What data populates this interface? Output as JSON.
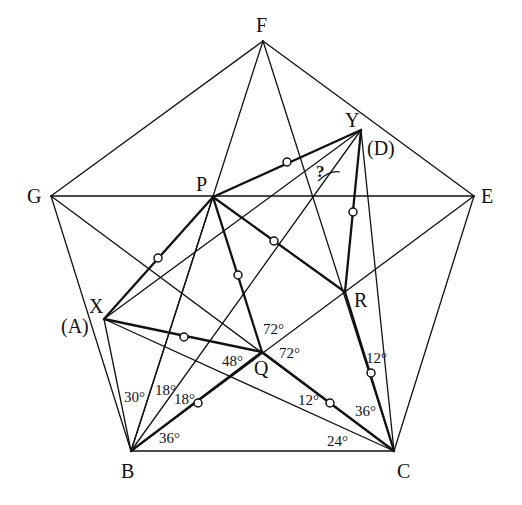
{
  "diagram": {
    "points": {
      "F": {
        "x": 263,
        "y": 41
      },
      "G": {
        "x": 51,
        "y": 196
      },
      "E": {
        "x": 474,
        "y": 196
      },
      "B": {
        "x": 131,
        "y": 451
      },
      "C": {
        "x": 394,
        "y": 451
      },
      "P": {
        "x": 213,
        "y": 197
      },
      "Q": {
        "x": 262,
        "y": 352
      },
      "R": {
        "x": 345,
        "y": 292
      },
      "X": {
        "x": 104,
        "y": 319
      },
      "Y": {
        "x": 361,
        "y": 130
      }
    },
    "labels": {
      "F": "F",
      "G": "G",
      "E": "E",
      "B": "B",
      "C": "C",
      "P": "P",
      "Q": "Q",
      "R": "R",
      "X": "X",
      "Y": "Y",
      "A_alias": "(A)",
      "D_alias": "(D)",
      "unknown": "?"
    },
    "angle_labels": {
      "B_30": "30°",
      "B_18a": "18°",
      "B_18b": "18°",
      "B_36": "36°",
      "C_24": "24°",
      "C_36": "36°",
      "C_12": "12°",
      "R_12": "12°",
      "Q_48": "48°",
      "Q_72a": "72°",
      "Q_72b": "72°"
    },
    "thin_segments": [
      [
        "F",
        "E"
      ],
      [
        "E",
        "C"
      ],
      [
        "C",
        "B"
      ],
      [
        "B",
        "G"
      ],
      [
        "G",
        "F"
      ],
      [
        "G",
        "E"
      ],
      [
        "G",
        "C"
      ],
      [
        "F",
        "B"
      ],
      [
        "F",
        "C"
      ],
      [
        "B",
        "E"
      ],
      [
        "X",
        "Y"
      ],
      [
        "X",
        "C"
      ],
      [
        "X",
        "B"
      ],
      [
        "B",
        "Y"
      ],
      [
        "Y",
        "C"
      ],
      [
        "B",
        "P"
      ]
    ],
    "thick_segments": [
      [
        "X",
        "P"
      ],
      [
        "X",
        "Q"
      ],
      [
        "P",
        "Q"
      ],
      [
        "P",
        "R"
      ],
      [
        "P",
        "Y"
      ],
      [
        "Y",
        "R"
      ],
      [
        "Q",
        "C"
      ],
      [
        "R",
        "C"
      ],
      [
        "B",
        "Q"
      ]
    ],
    "equal_marks": [
      {
        "x": 287,
        "y": 162
      },
      {
        "x": 158,
        "y": 258
      },
      {
        "x": 274,
        "y": 241
      },
      {
        "x": 238,
        "y": 275
      },
      {
        "x": 353,
        "y": 212
      },
      {
        "x": 184,
        "y": 337
      },
      {
        "x": 198,
        "y": 403
      },
      {
        "x": 330,
        "y": 403
      },
      {
        "x": 371,
        "y": 373
      }
    ]
  }
}
